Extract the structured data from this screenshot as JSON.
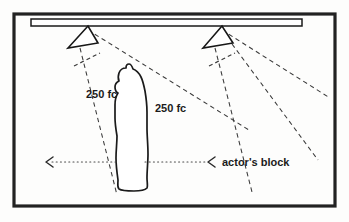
{
  "figure": {
    "frame": {
      "x": 14,
      "y": 14,
      "width": 321,
      "height": 192,
      "color": "#222222"
    },
    "background_color": "#fdfdfc",
    "ink_color": "#1a1a1a"
  },
  "batten": {
    "name": "lighting-pipe",
    "x": 31,
    "y": 19,
    "width": 271,
    "height": 7
  },
  "instruments": [
    {
      "id": "left-lantern",
      "label": "",
      "apex_x": 88,
      "apex_y": 26,
      "base_left_x": 68,
      "base_left_y": 48,
      "base_right_x": 98,
      "base_right_y": 43
    },
    {
      "id": "right-lantern",
      "label": "",
      "apex_x": 222,
      "apex_y": 26,
      "base_left_x": 203,
      "base_left_y": 48,
      "base_right_x": 233,
      "base_right_y": 43
    }
  ],
  "labels": {
    "left_intensity": "250 fc",
    "right_intensity": "250 fc",
    "block": "actor's block"
  },
  "label_positions": {
    "left_intensity": {
      "x": 86,
      "y": 98
    },
    "right_intensity": {
      "x": 155,
      "y": 112
    },
    "block": {
      "x": 222,
      "y": 166
    }
  },
  "actor": {
    "name": "actor-silhouette",
    "description": "standing human figure in profile, outlined",
    "center_x": 132,
    "top_y": 66,
    "bottom_y": 190
  },
  "block_line": {
    "y": 162,
    "left_arrow_x": 47,
    "right_arrow_x": 209,
    "segments": [
      {
        "x1": 52,
        "x2": 119
      },
      {
        "x1": 145,
        "x2": 205
      }
    ]
  },
  "beams": {
    "left": [
      {
        "x1": 80,
        "y1": 48,
        "x2": 117,
        "y2": 195
      },
      {
        "x1": 88,
        "y1": 30,
        "x2": 249,
        "y2": 130
      }
    ],
    "right": [
      {
        "x1": 215,
        "y1": 48,
        "x2": 252,
        "y2": 192
      },
      {
        "x1": 222,
        "y1": 30,
        "x2": 330,
        "y2": 98
      },
      {
        "x1": 232,
        "y1": 44,
        "x2": 318,
        "y2": 160
      }
    ],
    "stubs": [
      {
        "x1": 74,
        "y1": 66,
        "x2": 100,
        "y2": 53
      },
      {
        "x1": 209,
        "y1": 66,
        "x2": 235,
        "y2": 53
      }
    ]
  }
}
